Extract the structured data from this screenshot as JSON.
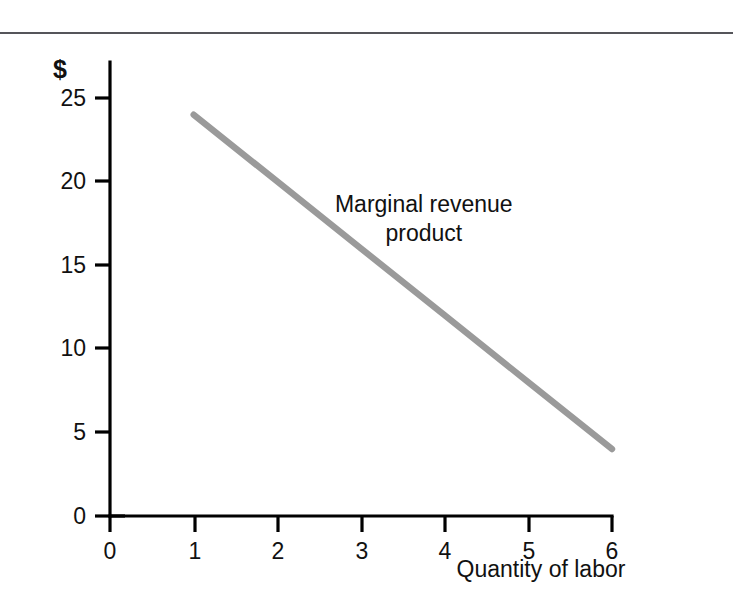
{
  "figure": {
    "top_rule_color": "#55555a",
    "background": "#ffffff"
  },
  "chart_data": {
    "type": "line",
    "title": "",
    "subtitle": "",
    "xlabel": "Quantity of labor",
    "ylabel": "",
    "y_unit_label": "$",
    "xlim": [
      0,
      6
    ],
    "ylim": [
      0,
      26.5
    ],
    "grid": false,
    "legend_position": "inline-annotation",
    "x_ticks": [
      "0",
      "1",
      "2",
      "3",
      "4",
      "5",
      "6"
    ],
    "x_tick_values": [
      0,
      1,
      2,
      3,
      4,
      5,
      6
    ],
    "y_ticks": [
      "0",
      "5",
      "10",
      "15",
      "20",
      "25"
    ],
    "y_tick_values": [
      0,
      5,
      10,
      15,
      20,
      25
    ],
    "series": [
      {
        "name": "Marginal revenue product",
        "color": "#9a9a9a",
        "x": [
          1,
          2,
          3,
          4,
          5,
          6
        ],
        "values": [
          24,
          20,
          16,
          12,
          8,
          4
        ]
      }
    ],
    "annotations": [
      {
        "name": "series-label",
        "line1": "Marginal revenue",
        "line2": "product",
        "x": 3.75,
        "y": 18.2
      }
    ]
  }
}
